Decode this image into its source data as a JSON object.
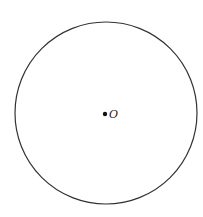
{
  "diagram": {
    "type": "circle-with-center",
    "circle": {
      "cx": 106,
      "cy": 113,
      "r": 91,
      "stroke": "#333333",
      "stroke_width": 1.2
    },
    "center_point": {
      "x": 105,
      "y": 114,
      "r": 2.2,
      "color": "#111111"
    },
    "center_label": {
      "text": "O",
      "x": 109,
      "y": 118
    }
  }
}
